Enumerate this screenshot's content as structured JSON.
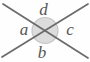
{
  "diagram": {
    "type": "two-intersecting-lines-vertical-angles",
    "labels": {
      "top": "d",
      "left": "a",
      "right": "c",
      "bottom": "b"
    },
    "colors": {
      "background": "#fefefe",
      "line": "#6b6b6b",
      "circle_fill": "#dcdcdc",
      "circle_stroke": "#c5c5c5",
      "label": "#555555"
    }
  }
}
